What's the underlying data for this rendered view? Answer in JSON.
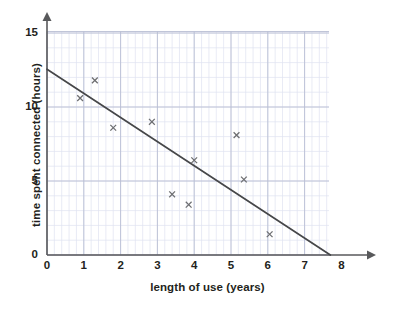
{
  "chart_data": {
    "type": "scatter",
    "title": "",
    "xlabel": "length of use (years)",
    "ylabel": "time spent connected (hours)",
    "xlim": [
      0,
      8.9
    ],
    "ylim": [
      0,
      15.6
    ],
    "xticks": [
      0,
      1,
      2,
      3,
      4,
      5,
      6,
      7,
      8
    ],
    "xtick_labels": [
      "0",
      "1",
      "2",
      "3",
      "4",
      "5",
      "6",
      "7",
      "8"
    ],
    "yticks": [
      0,
      5,
      10,
      15
    ],
    "ytick_labels": [
      "0",
      "5",
      "10",
      "15"
    ],
    "grid": true,
    "grid_minor_step_x": 0.2,
    "grid_minor_step_y": 1,
    "grid_major_step_x": 1,
    "grid_major_step_y": 5,
    "legend": null,
    "marker": "x",
    "points": [
      {
        "x": 0.9,
        "y": 10.6
      },
      {
        "x": 1.3,
        "y": 11.8
      },
      {
        "x": 1.8,
        "y": 8.6
      },
      {
        "x": 2.85,
        "y": 9.0
      },
      {
        "x": 3.4,
        "y": 4.1
      },
      {
        "x": 3.85,
        "y": 3.4
      },
      {
        "x": 4.0,
        "y": 6.4
      },
      {
        "x": 5.15,
        "y": 8.1
      },
      {
        "x": 5.35,
        "y": 5.1
      },
      {
        "x": 6.05,
        "y": 1.4
      }
    ],
    "trend_line": {
      "label": "line of best fit",
      "x_start": 0.0,
      "y_start": 12.55,
      "x_end": 7.7,
      "y_end": 0.0
    },
    "colors": {
      "background": "#ffffff",
      "axis": "#58595b",
      "grid_minor": "#dfe3f0",
      "grid_major": "#b9bed4",
      "marker": "#6d6e71",
      "trend_line": "#464749",
      "text": "#231f20"
    }
  }
}
